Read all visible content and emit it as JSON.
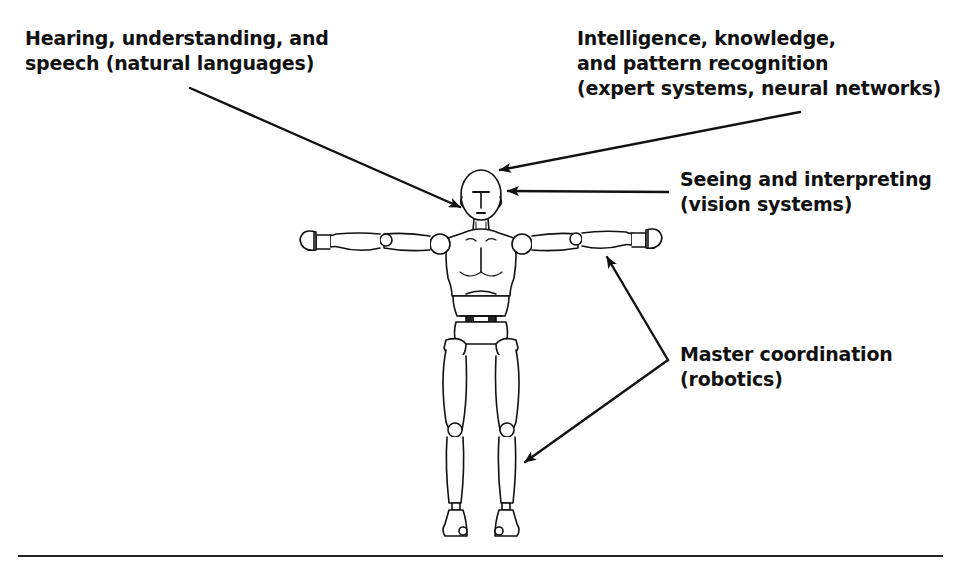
{
  "diagram": {
    "type": "annotated-illustration",
    "labels": {
      "hearing": {
        "lines": [
          "Hearing, understanding, and",
          "speech (natural languages)"
        ],
        "points_to": "ear"
      },
      "intelligence": {
        "lines": [
          "Intelligence, knowledge,",
          "and pattern recognition",
          "(expert systems, neural networks)"
        ],
        "points_to": "top of head"
      },
      "seeing": {
        "lines": [
          "Seeing and interpreting",
          "(vision systems)"
        ],
        "points_to": "eyes"
      },
      "master": {
        "lines": [
          "Master coordination",
          "(robotics)"
        ],
        "points_to": [
          "right forearm",
          "right lower leg"
        ]
      }
    },
    "colors": {
      "ink": "#111111",
      "background": "#ffffff"
    }
  }
}
